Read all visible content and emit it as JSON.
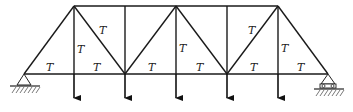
{
  "diagram": {
    "type": "truss",
    "labels": {
      "tension": "T"
    },
    "colors": {
      "line": "#1a1a1a",
      "background": "#ffffff"
    },
    "nodes": {
      "top": [
        [
          74,
          6
        ],
        [
          125,
          6
        ],
        [
          176,
          6
        ],
        [
          227,
          6
        ],
        [
          278,
          6
        ]
      ],
      "bottom": [
        [
          24,
          74
        ],
        [
          74,
          74
        ],
        [
          125,
          74
        ],
        [
          176,
          74
        ],
        [
          227,
          74
        ],
        [
          278,
          74
        ],
        [
          328,
          74
        ]
      ]
    },
    "supports": [
      {
        "type": "pin",
        "x": 24,
        "y": 74
      },
      {
        "type": "roller",
        "x": 328,
        "y": 74
      }
    ],
    "loads": [
      {
        "x": 74,
        "direction": "down"
      },
      {
        "x": 125,
        "direction": "down"
      },
      {
        "x": 176,
        "direction": "down"
      },
      {
        "x": 227,
        "direction": "down"
      },
      {
        "x": 278,
        "direction": "down"
      }
    ],
    "member_labels": [
      {
        "member": "bottom-24-74",
        "text": "T"
      },
      {
        "member": "bottom-74-125",
        "text": "T"
      },
      {
        "member": "bottom-125-176",
        "text": "T"
      },
      {
        "member": "bottom-176-227",
        "text": "T"
      },
      {
        "member": "bottom-227-278",
        "text": "T"
      },
      {
        "member": "bottom-278-328",
        "text": "T"
      },
      {
        "member": "vertical-74",
        "text": "T"
      },
      {
        "member": "vertical-176",
        "text": "T"
      },
      {
        "member": "vertical-278",
        "text": "T"
      },
      {
        "member": "diagonal-74-125",
        "text": "T"
      },
      {
        "member": "diagonal-227-278",
        "text": "T"
      }
    ]
  }
}
